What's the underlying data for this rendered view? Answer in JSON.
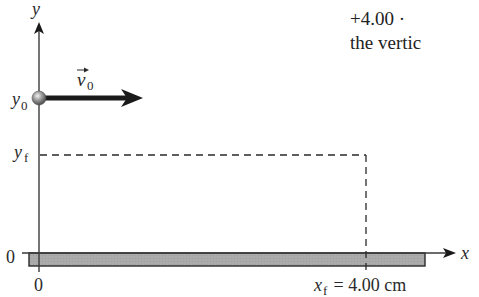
{
  "figure": {
    "type": "projectile-motion-diagram",
    "axes": {
      "x_label": "x",
      "y_label": "y",
      "x_origin_label": "0",
      "y_origin_label": "0"
    },
    "initial_height_label": "y",
    "initial_height_sub": "0",
    "final_height_label": "y",
    "final_height_sub": "f",
    "velocity_label": "v",
    "velocity_sub": "0",
    "final_x_label": "x",
    "final_x_sub": "f",
    "final_x_value": " = 4.00 cm",
    "colors": {
      "axis": "#3a3a3a",
      "arrow": "#1a1a1a",
      "floor_fill": "#a8a8a8",
      "floor_stroke": "#2a2a2a",
      "dash": "#2a2a2a",
      "ball": "#8a8a8a"
    }
  },
  "cropped_text": {
    "line1": "+4.00 · ",
    "line2": "the vertic"
  }
}
